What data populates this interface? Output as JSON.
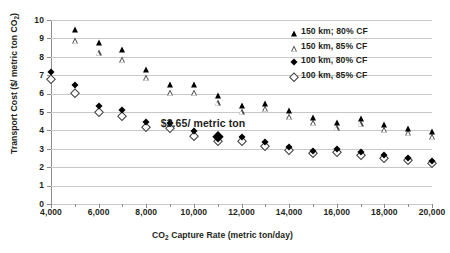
{
  "chart_data": {
    "type": "scatter",
    "title": "",
    "xlabel": "CO2 Capture Rate (metric ton/day)",
    "ylabel": "Transport Cost ($/ metric ton CO2)",
    "xlabel_parts": {
      "pre": "CO",
      "sub": "2",
      "post": " Capture Rate (metric ton/day)"
    },
    "ylabel_parts": {
      "pre": "Transport Cost ($/ metric ton CO",
      "sub": "2",
      "post": ")"
    },
    "xlim": [
      4000,
      20000
    ],
    "ylim": [
      0,
      10
    ],
    "grid": true,
    "x_tick_labels": [
      "4,000",
      "6,000",
      "8,000",
      "10,000",
      "12,000",
      "14,000",
      "16,000",
      "18,000",
      "20,000"
    ],
    "x_tick_values": [
      4000,
      6000,
      8000,
      10000,
      12000,
      14000,
      16000,
      18000,
      20000
    ],
    "x_minor_values": [
      5000,
      7000,
      9000,
      11000,
      13000,
      15000,
      17000,
      19000
    ],
    "y_tick_labels": [
      "0",
      "1",
      "2",
      "3",
      "4",
      "5",
      "6",
      "7",
      "8",
      "9",
      "10"
    ],
    "y_tick_values": [
      0,
      1,
      2,
      3,
      4,
      5,
      6,
      7,
      8,
      9,
      10
    ],
    "legend_position": "top-right",
    "annotations": [
      {
        "text": "$3.65/ metric ton",
        "x": 11000,
        "y": 4.35
      }
    ],
    "highlight_point": {
      "x": 11000,
      "y": 3.65,
      "series": "100 km, 80% CF"
    },
    "series": [
      {
        "name": "150 km; 80% CF",
        "marker": "filled-triangle",
        "color": "#000000",
        "x": [
          5000,
          6000,
          7000,
          8000,
          9000,
          10000,
          11000,
          12000,
          13000,
          14000,
          15000,
          16000,
          17000,
          18000,
          19000,
          20000
        ],
        "values": [
          9.5,
          8.8,
          8.4,
          7.35,
          6.5,
          6.5,
          5.9,
          5.4,
          5.5,
          5.1,
          4.75,
          4.45,
          4.65,
          4.35,
          4.15,
          3.95
        ]
      },
      {
        "name": "150 km, 85% CF",
        "marker": "open-triangle",
        "color": "#4a4a4a",
        "x": [
          5000,
          6000,
          7000,
          8000,
          9000,
          10000,
          11000,
          12000,
          13000,
          14000,
          15000,
          16000,
          17000,
          18000,
          19000,
          20000
        ],
        "values": [
          8.9,
          8.25,
          7.9,
          6.9,
          6.1,
          6.1,
          5.55,
          5.05,
          5.2,
          4.8,
          4.45,
          4.2,
          4.4,
          4.1,
          3.9,
          3.7
        ]
      },
      {
        "name": "100 km, 80% CF",
        "marker": "filled-diamond",
        "color": "#000000",
        "x": [
          4000,
          5000,
          6000,
          7000,
          8000,
          9000,
          10000,
          11000,
          12000,
          13000,
          14000,
          15000,
          16000,
          17000,
          18000,
          19000,
          20000
        ],
        "values": [
          7.2,
          6.45,
          5.35,
          5.1,
          4.45,
          4.4,
          3.95,
          3.65,
          3.65,
          3.35,
          3.1,
          2.9,
          3.0,
          2.85,
          2.65,
          2.5,
          2.35
        ]
      },
      {
        "name": "100 km, 85% CF",
        "marker": "open-diamond",
        "color": "#3d3d3d",
        "x": [
          4000,
          5000,
          6000,
          7000,
          8000,
          9000,
          10000,
          11000,
          12000,
          13000,
          14000,
          15000,
          16000,
          17000,
          18000,
          19000,
          20000
        ],
        "values": [
          6.8,
          6.05,
          5.0,
          4.8,
          4.2,
          4.15,
          3.7,
          3.45,
          3.45,
          3.15,
          2.95,
          2.75,
          2.85,
          2.65,
          2.5,
          2.4,
          2.25
        ]
      }
    ]
  }
}
